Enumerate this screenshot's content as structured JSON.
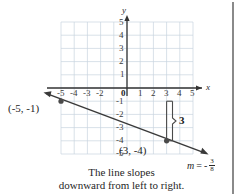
{
  "figure": {
    "type": "coordinate-graph",
    "axes": {
      "x_label": "x",
      "y_label": "y",
      "x_ticks": [
        "-5",
        "-4",
        "-3",
        "-2",
        "1",
        "2",
        "3",
        "4",
        "5"
      ],
      "y_ticks_positive": [
        "5",
        "4",
        "3",
        "2",
        "1"
      ],
      "y_ticks_negative": [
        "-1",
        "-2",
        "-3",
        "-4",
        "-5"
      ],
      "origin_label": "0",
      "xlim": [
        -5,
        5
      ],
      "ylim": [
        -5,
        5
      ],
      "grid": true
    },
    "points": [
      {
        "label": "(-5, -1)",
        "x": -5,
        "y": -1
      },
      {
        "label": "(3, -4)",
        "x": 3,
        "y": -4
      }
    ],
    "rise_label": "3",
    "slope": {
      "variable": "m",
      "equals": "=",
      "sign": "-",
      "numerator": "3",
      "denominator": "8"
    },
    "caption_line1": "The line slopes",
    "caption_line2": "downward from left to right.",
    "colors": {
      "grid": "#c9d4e0",
      "axis": "#333333",
      "line": "#3a3a3a",
      "point": "#4a4a4a",
      "text": "#262626",
      "rule": "#8a8a8a"
    }
  }
}
